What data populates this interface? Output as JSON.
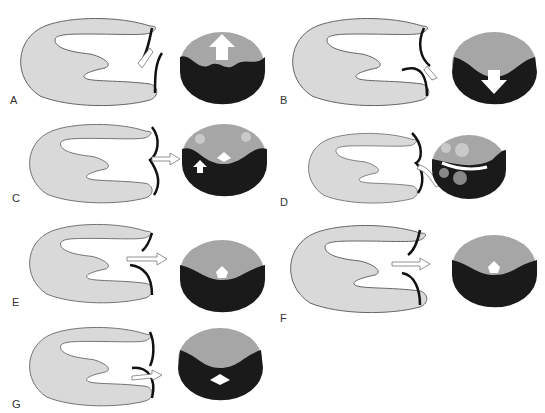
{
  "figure": {
    "colors": {
      "heart_fill": "#d9d9d9",
      "heart_stroke": "#666666",
      "leaflet_dark": "#111111",
      "circle_upper": "#a6a6a6",
      "circle_lower": "#1a1a1a",
      "arrow_fill": "#ffffff"
    },
    "panels": [
      {
        "id": "A",
        "label": "A",
        "flow": "up"
      },
      {
        "id": "B",
        "label": "B",
        "flow": "down"
      },
      {
        "id": "C",
        "label": "C",
        "flow": "central-with-small-down"
      },
      {
        "id": "D",
        "label": "D",
        "flow": "curved-lateral"
      },
      {
        "id": "E",
        "label": "E",
        "flow": "central-pentagon"
      },
      {
        "id": "F",
        "label": "F",
        "flow": "central-pentagon"
      },
      {
        "id": "G",
        "label": "G",
        "flow": "diamond-below"
      }
    ]
  }
}
